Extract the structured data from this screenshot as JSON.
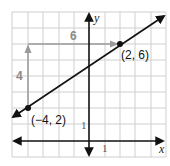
{
  "graph": {
    "axes": {
      "x_label": "x",
      "y_label": "y",
      "x_tick_label": "1",
      "y_tick_label": "1"
    },
    "grid": {
      "x_min": -5,
      "x_max": 5,
      "y_min": -1,
      "y_max": 8,
      "step": 1
    },
    "points": [
      {
        "x": -4,
        "y": 2,
        "label": "(−4, 2)"
      },
      {
        "x": 2,
        "y": 6,
        "label": "(2, 6)"
      }
    ],
    "rise": {
      "label": "4",
      "value": 4
    },
    "run": {
      "label": "6",
      "value": 6
    },
    "colors": {
      "grid": "#cfcfcf",
      "axis": "#111111",
      "line": "#111111",
      "guide": "#9a9a9a",
      "guide_label": "#8a8a8a"
    }
  }
}
